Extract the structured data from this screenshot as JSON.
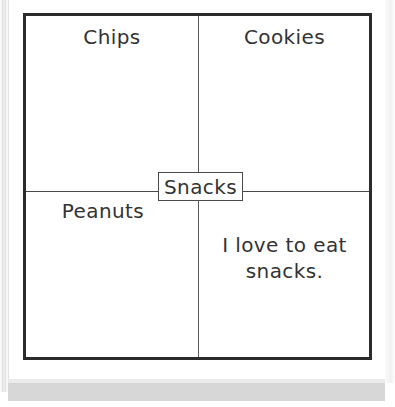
{
  "diagram": {
    "type": "four-square-graphic-organizer",
    "center": {
      "label": "Snacks"
    },
    "quadrants": [
      {
        "position": "top-left",
        "label": "Chips"
      },
      {
        "position": "top-right",
        "label": "Cookies"
      },
      {
        "position": "bottom-left",
        "label": "Peanuts"
      },
      {
        "position": "bottom-right",
        "label": "I love to eat\nsnacks."
      }
    ],
    "colors": {
      "frame": "#2b2b2b",
      "divider": "#4a4a4a",
      "text": "#333333",
      "page_background": "#ffffff",
      "page_shadow": "#d7d7d7"
    }
  }
}
